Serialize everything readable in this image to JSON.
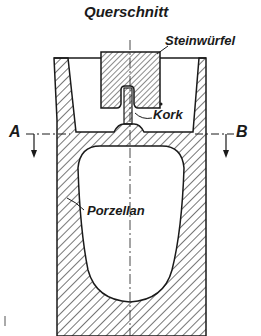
{
  "diagram": {
    "title": "Querschnitt",
    "labels": {
      "stone_cube": "Steinwürfel",
      "cork": "Kork",
      "porcelain": "Porzellan",
      "section_left": "A",
      "section_right": "B"
    },
    "colors": {
      "ink": "#1a1a1a",
      "background": "#ffffff"
    }
  }
}
